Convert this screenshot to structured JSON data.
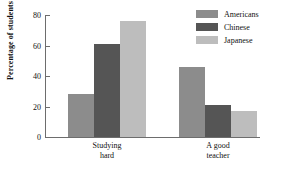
{
  "chart_data": {
    "type": "bar",
    "title": "",
    "xlabel": "",
    "ylabel": "Percentage of students",
    "ylim": [
      0,
      80
    ],
    "yticks": [
      0,
      20,
      40,
      60,
      80
    ],
    "grid": false,
    "legend_position": "top-right",
    "categories": [
      "Studying hard",
      "A good teacher"
    ],
    "category_lines": [
      {
        "line1": "Studying",
        "line2": "hard"
      },
      {
        "line1": "A good",
        "line2": "teacher"
      }
    ],
    "series": [
      {
        "name": "Americans",
        "color": "#8c8c8c",
        "values": [
          28,
          46
        ]
      },
      {
        "name": "Chinese",
        "color": "#555555",
        "values": [
          61,
          21
        ]
      },
      {
        "name": "Japanese",
        "color": "#bdbdbd",
        "values": [
          76,
          17
        ]
      }
    ]
  },
  "axis": {
    "tick_labels": [
      "0",
      "20",
      "40",
      "60",
      "80"
    ],
    "y_title": "Percentage of students",
    "axis_color": "#6d6d6d"
  },
  "legend": {
    "items": [
      {
        "label": "Americans",
        "color": "#8c8c8c"
      },
      {
        "label": "Chinese",
        "color": "#555555"
      },
      {
        "label": "Japanese",
        "color": "#bdbdbd"
      }
    ]
  }
}
